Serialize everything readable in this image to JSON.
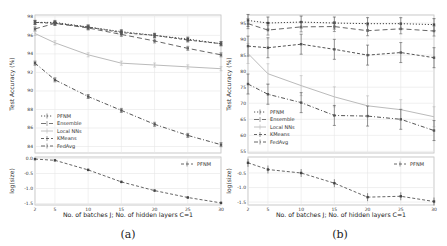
{
  "chart_data": [
    {
      "panel": "(a)",
      "type": "line",
      "caption": "(a)",
      "xlabel": "No. of batches J; No. of hidden layers C=1",
      "x": [
        2,
        5,
        10,
        15,
        20,
        25,
        30
      ],
      "top": {
        "ylabel": "Test Accuracy (%)",
        "ylim": [
          83.3,
          98.2
        ],
        "yticks": [
          84,
          86,
          88,
          90,
          92,
          94,
          96,
          98
        ],
        "grid": true,
        "legend_position": "lower left",
        "series": [
          {
            "name": "PFNM",
            "values": [
              97.4,
              97.4,
              96.9,
              96.4,
              96.0,
              95.6,
              95.1
            ],
            "style": "dotted",
            "marker": "square"
          },
          {
            "name": "Ensemble",
            "values": [
              96.7,
              97.3,
              96.8,
              96.1,
              95.4,
              94.6,
              93.9
            ],
            "style": "dashed-long",
            "marker": "square"
          },
          {
            "name": "Local NNs",
            "values": [
              96.2,
              95.2,
              93.9,
              93.0,
              92.8,
              92.6,
              92.4
            ],
            "style": "solid-light",
            "marker": "none"
          },
          {
            "name": "KMeans",
            "values": [
              97.4,
              97.3,
              96.9,
              96.3,
              96.0,
              95.5,
              95.1
            ],
            "style": "dash",
            "marker": "square"
          },
          {
            "name": "FedAvg",
            "values": [
              93.0,
              91.2,
              89.4,
              87.9,
              86.4,
              85.2,
              84.2
            ],
            "style": "dash-dot",
            "marker": "square"
          }
        ]
      },
      "bottom": {
        "ylabel": "log(size)",
        "ylim": [
          -1.55,
          0.05
        ],
        "yticks": [
          0.0,
          -0.5,
          -1.0,
          -1.5
        ],
        "legend_position": "upper right",
        "series": [
          {
            "name": "PFNM",
            "values": [
              -0.02,
              -0.06,
              -0.38,
              -0.78,
              -1.07,
              -1.3,
              -1.48
            ]
          }
        ]
      }
    },
    {
      "panel": "(b)",
      "type": "line",
      "caption": "(b)",
      "xlabel": "No. of batches J; No. of hidden layers C=1",
      "x": [
        2,
        5,
        10,
        15,
        20,
        25,
        30
      ],
      "top": {
        "ylabel": "Test Accuracy (%)",
        "ylim": [
          54.5,
          97.5
        ],
        "yticks": [
          55,
          60,
          65,
          70,
          75,
          80,
          85,
          90,
          95
        ],
        "grid": true,
        "legend_position": "lower left",
        "series": [
          {
            "name": "PFNM",
            "values": [
              95.8,
              95.0,
              95.3,
              95.0,
              94.8,
              94.8,
              94.5
            ]
          },
          {
            "name": "Ensemble",
            "values": [
              94.8,
              92.8,
              93.8,
              93.9,
              92.6,
              93.2,
              92.5
            ]
          },
          {
            "name": "Local NNs",
            "values": [
              85.5,
              79.2,
              75.5,
              72.0,
              69.2,
              68.0,
              65.8
            ]
          },
          {
            "name": "KMeans",
            "values": [
              87.8,
              87.3,
              88.4,
              86.8,
              85.0,
              85.8,
              84.2
            ]
          },
          {
            "name": "FedAvg",
            "values": [
              76.0,
              72.8,
              70.2,
              66.2,
              66.0,
              65.0,
              61.5
            ]
          }
        ]
      },
      "bottom": {
        "ylabel": "log(size)",
        "ylim": [
          -1.6,
          0.05
        ],
        "yticks": [
          -0.5,
          -1.0,
          -1.5
        ],
        "legend_position": "upper right",
        "series": [
          {
            "name": "PFNM",
            "values": [
              -0.15,
              -0.38,
              -0.5,
              -0.85,
              -1.33,
              -1.3,
              -1.48
            ]
          }
        ]
      }
    }
  ],
  "panels": [
    {
      "caption": "(a)",
      "xlabel": "No. of batches J; No. of hidden layers C=1",
      "top_ylabel": "Test Accuracy (%)",
      "bottom_ylabel": "log(size)",
      "xticks": [
        "2",
        "5",
        "10",
        "15",
        "20",
        "25",
        "30"
      ],
      "top_yticks": [
        "84",
        "86",
        "88",
        "90",
        "92",
        "94",
        "96",
        "98"
      ],
      "bottom_yticks": [
        "0.0",
        "-0.5",
        "-1.0",
        "-1.5"
      ],
      "legend": [
        "PFNM",
        "Ensemble",
        "Local NNs",
        "KMeans",
        "FedAvg"
      ],
      "bottom_legend": "PFNM"
    },
    {
      "caption": "(b)",
      "xlabel": "No. of batches J; No. of hidden layers C=1",
      "top_ylabel": "Test Accuracy (%)",
      "bottom_ylabel": "log(size)",
      "xticks": [
        "2",
        "5",
        "10",
        "15",
        "20",
        "25",
        "30"
      ],
      "top_yticks": [
        "55",
        "60",
        "65",
        "70",
        "75",
        "80",
        "85",
        "90",
        "95"
      ],
      "bottom_yticks": [
        "-0.5",
        "-1.0",
        "-1.5"
      ],
      "legend": [
        "PFNM",
        "Ensemble",
        "Local NNs",
        "KMeans",
        "FedAvg"
      ],
      "bottom_legend": "PFNM"
    }
  ]
}
